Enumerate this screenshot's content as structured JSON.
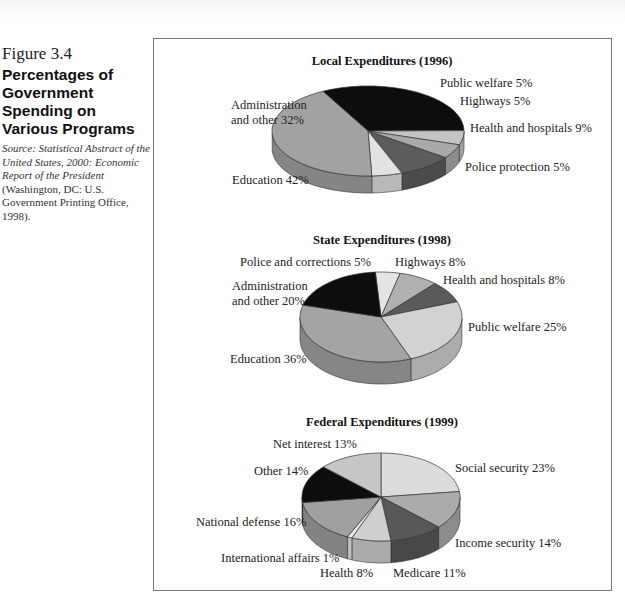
{
  "figure": {
    "number": "Figure 3.4",
    "title": "Percentages of Government Spending on Various Programs",
    "source_italic": "Source: Statistical Abstract of the United States, 2000: Economic Report of the President",
    "source_plain": " (Washington, DC: U.S. Government Printing Office, 1998)."
  },
  "chart_data": [
    {
      "type": "pie",
      "title": "Local Expenditures (1996)",
      "slices": [
        {
          "label": "Administration and other",
          "value": 32,
          "text": [
            "Administration",
            "and other 32%"
          ],
          "color": "#0d0d0d"
        },
        {
          "label": "Public welfare",
          "value": 5,
          "text": [
            "Public welfare 5%"
          ],
          "color": "#c4c4c4"
        },
        {
          "label": "Highways",
          "value": 5,
          "text": [
            "Highways 5%"
          ],
          "color": "#a9a9a9"
        },
        {
          "label": "Health and hospitals",
          "value": 9,
          "text": [
            "Health and hospitals 9%"
          ],
          "color": "#5c5c5c"
        },
        {
          "label": "Police protection",
          "value": 5,
          "text": [
            "Police protection 5%"
          ],
          "color": "#e2e2e2"
        },
        {
          "label": "Education",
          "value": 42,
          "text": [
            "Education 42%"
          ],
          "color": "#a2a2a2"
        }
      ]
    },
    {
      "type": "pie",
      "title": "State Expenditures (1998)",
      "slices": [
        {
          "label": "Police and corrections",
          "value": 5,
          "text": [
            "Police and corrections 5%"
          ],
          "color": "#e4e4e4"
        },
        {
          "label": "Highways",
          "value": 8,
          "text": [
            "Highways 8%"
          ],
          "color": "#b0b0b0"
        },
        {
          "label": "Health and hospitals",
          "value": 8,
          "text": [
            "Health and hospitals 8%"
          ],
          "color": "#5a5a5a"
        },
        {
          "label": "Public welfare",
          "value": 25,
          "text": [
            "Public welfare 25%"
          ],
          "color": "#d2d2d2"
        },
        {
          "label": "Education",
          "value": 36,
          "text": [
            "Education 36%"
          ],
          "color": "#a4a4a4"
        },
        {
          "label": "Administration and other",
          "value": 20,
          "text": [
            "Administration",
            "and other 20%"
          ],
          "color": "#0d0d0d"
        }
      ]
    },
    {
      "type": "pie",
      "title": "Federal Expenditures (1999)",
      "slices": [
        {
          "label": "Social security",
          "value": 23,
          "text": [
            "Social security 23%"
          ],
          "color": "#dcdcdc"
        },
        {
          "label": "Income security",
          "value": 14,
          "text": [
            "Income security 14%"
          ],
          "color": "#ababab"
        },
        {
          "label": "Medicare",
          "value": 11,
          "text": [
            "Medicare 11%"
          ],
          "color": "#585858"
        },
        {
          "label": "Health",
          "value": 8,
          "text": [
            "Health 8%"
          ],
          "color": "#cfcfcf"
        },
        {
          "label": "International affairs",
          "value": 1,
          "text": [
            "International affairs 1%"
          ],
          "color": "#e8e8e8"
        },
        {
          "label": "National defense",
          "value": 16,
          "text": [
            "National defense 16%"
          ],
          "color": "#a0a0a0"
        },
        {
          "label": "Other",
          "value": 14,
          "text": [
            "Other 14%"
          ],
          "color": "#0d0d0d"
        },
        {
          "label": "Net interest",
          "value": 13,
          "text": [
            "Net interest 13%"
          ],
          "color": "#c6c6c6"
        }
      ]
    }
  ]
}
